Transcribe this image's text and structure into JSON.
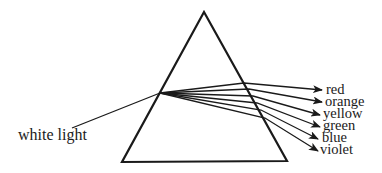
{
  "diagram": {
    "incident_label": "white light",
    "prism": {
      "apex": [
        204,
        12
      ],
      "bottom_left": [
        122,
        162
      ],
      "bottom_right": [
        287,
        161
      ]
    },
    "incident_ray": {
      "from": [
        72,
        128
      ],
      "to": [
        160,
        93
      ]
    },
    "rays": [
      {
        "label": "red",
        "exit": [
          244,
          83
        ],
        "tip": [
          322,
          90
        ],
        "text_pos": [
          326,
          94
        ]
      },
      {
        "label": "orange",
        "exit": [
          249,
          89
        ],
        "tip": [
          322,
          102
        ],
        "text_pos": [
          325,
          106
        ]
      },
      {
        "label": "yellow",
        "exit": [
          253,
          96
        ],
        "tip": [
          320,
          115
        ],
        "text_pos": [
          323,
          118
        ]
      },
      {
        "label": "green",
        "exit": [
          257,
          103
        ],
        "tip": [
          320,
          127
        ],
        "text_pos": [
          323,
          130
        ]
      },
      {
        "label": "blue",
        "exit": [
          261,
          110
        ],
        "tip": [
          318,
          139
        ],
        "text_pos": [
          322,
          142
        ]
      },
      {
        "label": "violet",
        "exit": [
          265,
          118
        ],
        "tip": [
          318,
          151
        ],
        "text_pos": [
          320,
          154
        ]
      }
    ],
    "stroke_color": "#1a1a1a"
  }
}
